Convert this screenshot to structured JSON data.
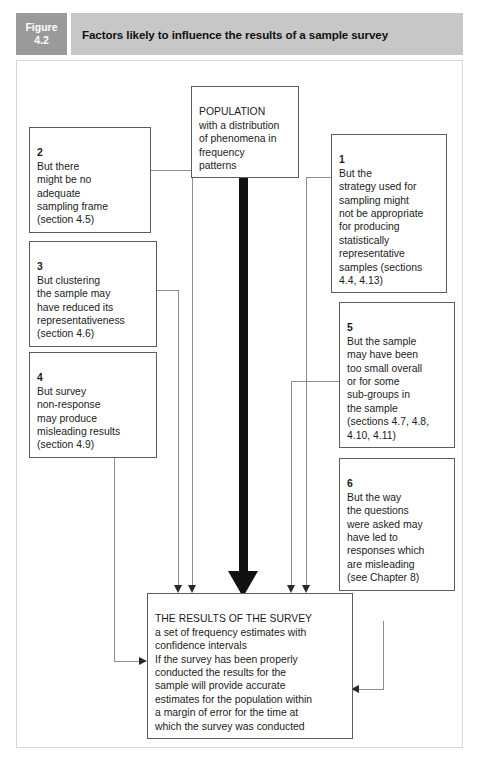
{
  "figure": {
    "label_line1": "Figure",
    "label_line2": "4.2",
    "title": "Factors likely to influence the results of a sample survey",
    "tab_color": "#9a9a9a",
    "title_bar_color": "#c7c7c7"
  },
  "diagram": {
    "type": "flowchart",
    "population": {
      "text": "POPULATION\nwith a distribution\nof phenomena in\nfrequency\npatterns"
    },
    "results": {
      "text": "THE RESULTS OF THE SURVEY\na set of frequency estimates with\nconfidence intervals\nIf the survey has been properly\nconducted the results for the\nsample will provide accurate\nestimates for the population within\na margin of error for the time at\nwhich the survey was conducted"
    },
    "factors": [
      {
        "number": "1",
        "side": "right",
        "text": "But the\nstrategy used for\nsampling might\nnot be appropriate\nfor producing\nstatistically\nrepresentative\nsamples (sections\n4.4, 4.13)"
      },
      {
        "number": "2",
        "side": "left",
        "text": "But there\nmight be no\nadequate\nsampling frame\n(section 4.5)"
      },
      {
        "number": "3",
        "side": "left",
        "text": "But clustering\nthe sample may\nhave reduced its\nrepresentativeness\n(section 4.6)"
      },
      {
        "number": "4",
        "side": "left",
        "text": "But survey\nnon-response\nmay produce\nmisleading results\n(section 4.9)"
      },
      {
        "number": "5",
        "side": "right",
        "text": "But the sample\nmay have been\ntoo small overall\nor for some\nsub-groups in\nthe sample\n(sections 4.7, 4.8,\n4.10, 4.11)"
      },
      {
        "number": "6",
        "side": "right",
        "text": "But the way\nthe questions\nwere asked may\nhave led to\nresponses which\nare misleading\n(see Chapter 8)"
      }
    ],
    "colors": {
      "node_border": "#5d5d5d",
      "connector": "#8d8d8d",
      "main_arrow": "#111111",
      "text": "#1c1c1c"
    }
  }
}
